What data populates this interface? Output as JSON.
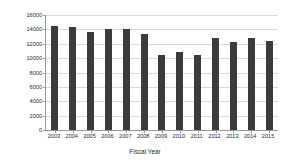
{
  "chart_data": {
    "type": "bar",
    "title": "",
    "xlabel": "Fiscal Year",
    "ylabel": "R&D Budget - NASA",
    "categories": [
      "2003",
      "2004",
      "2005",
      "2006",
      "2007",
      "2008",
      "2009",
      "2010",
      "2011",
      "2012",
      "2013",
      "2014",
      "2015"
    ],
    "values": [
      14500,
      14300,
      13700,
      14100,
      14100,
      13350,
      10400,
      10800,
      10450,
      12750,
      12250,
      12800,
      12350
    ],
    "ylim": [
      0,
      16000
    ],
    "ytick_labels": [
      "16000",
      "14000",
      "12000",
      "10000",
      "8000",
      "6000",
      "4000",
      "2000",
      "0"
    ],
    "ytick_values": [
      16000,
      14000,
      12000,
      10000,
      8000,
      6000,
      4000,
      2000,
      0
    ],
    "grid": true,
    "legend": false,
    "bar_color": "#3b3b3b",
    "grid_color": "#d9d9d9",
    "axis_color": "#9a9a9a",
    "background": "#ffffff"
  }
}
